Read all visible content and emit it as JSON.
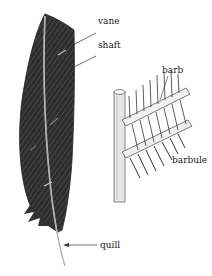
{
  "diagram": {
    "labels": {
      "vane": "vane",
      "shaft": "shaft",
      "barb": "barb",
      "barbule": "barbule",
      "quill": "quill"
    },
    "colors": {
      "feather_dark": "#2a2a2a",
      "feather_mid": "#555555",
      "shaft_light": "#d8d8d8",
      "line": "#333333",
      "background": "#ffffff"
    }
  }
}
